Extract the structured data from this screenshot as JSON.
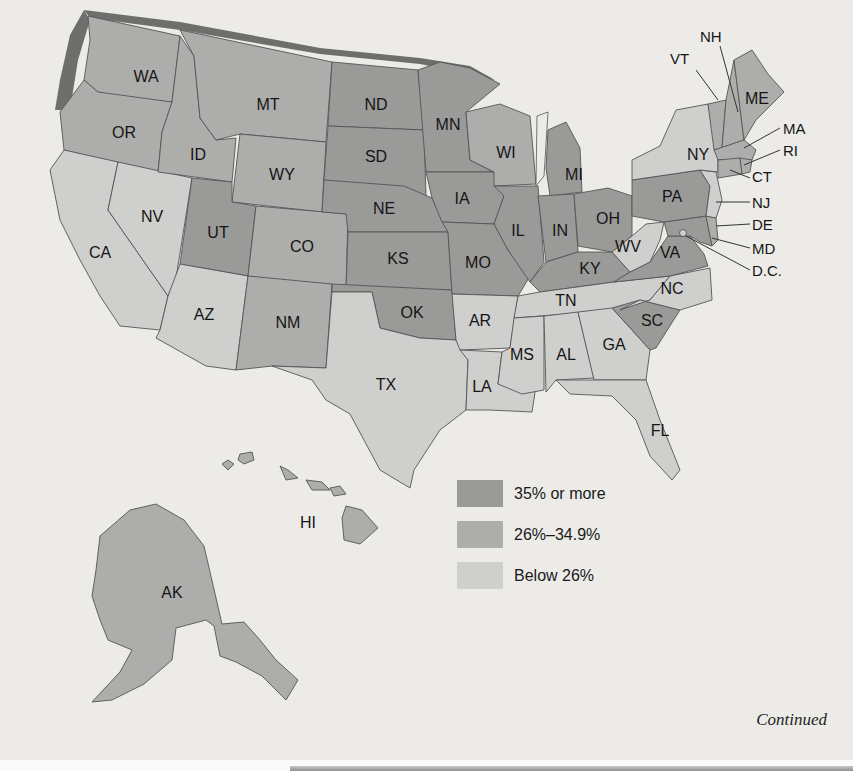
{
  "map": {
    "type": "choropleth",
    "region": "United States",
    "colors": {
      "high": "#9a9a98",
      "mid": "#adadab",
      "low": "#cfcfcd",
      "shadow": "#6e6e6c",
      "background": "#ecebe8"
    },
    "legend": [
      {
        "key": "high",
        "label": "35% or more"
      },
      {
        "key": "mid",
        "label": "26%–34.9%"
      },
      {
        "key": "low",
        "label": "Below 26%"
      }
    ],
    "states": {
      "WA": "mid",
      "OR": "mid",
      "CA": "low",
      "NV": "low",
      "ID": "mid",
      "MT": "mid",
      "WY": "mid",
      "UT": "high",
      "CO": "mid",
      "AZ": "low",
      "NM": "mid",
      "ND": "high",
      "SD": "high",
      "NE": "high",
      "KS": "high",
      "OK": "high",
      "TX": "low",
      "MN": "high",
      "IA": "high",
      "MO": "high",
      "AR": "low",
      "LA": "low",
      "WI": "mid",
      "IL": "high",
      "MI": "high",
      "IN": "high",
      "OH": "high",
      "KY": "high",
      "TN": "low",
      "MS": "low",
      "AL": "low",
      "GA": "low",
      "FL": "low",
      "SC": "high",
      "NC": "low",
      "VA": "high",
      "WV": "low",
      "PA": "high",
      "NY": "low",
      "VT": "mid",
      "NH": "mid",
      "ME": "mid",
      "MA": "mid",
      "RI": "mid",
      "CT": "mid",
      "NJ": "low",
      "DE": "mid",
      "MD": "high",
      "DC": "low",
      "AK": "mid",
      "HI": "mid"
    },
    "labels": {
      "WA": "WA",
      "OR": "OR",
      "CA": "CA",
      "NV": "NV",
      "ID": "ID",
      "MT": "MT",
      "WY": "WY",
      "UT": "UT",
      "CO": "CO",
      "AZ": "AZ",
      "NM": "NM",
      "ND": "ND",
      "SD": "SD",
      "NE": "NE",
      "KS": "KS",
      "OK": "OK",
      "TX": "TX",
      "MN": "MN",
      "IA": "IA",
      "MO": "MO",
      "AR": "AR",
      "LA": "LA",
      "WI": "WI",
      "IL": "IL",
      "MI": "MI",
      "IN": "IN",
      "OH": "OH",
      "KY": "KY",
      "TN": "TN",
      "MS": "MS",
      "AL": "AL",
      "GA": "GA",
      "FL": "FL",
      "SC": "SC",
      "NC": "NC",
      "VA": "VA",
      "WV": "WV",
      "PA": "PA",
      "NY": "NY",
      "VT": "VT",
      "NH": "NH",
      "ME": "ME",
      "MA": "MA",
      "RI": "RI",
      "CT": "CT",
      "NJ": "NJ",
      "DE": "DE",
      "MD": "MD",
      "DC": "D.C.",
      "AK": "AK",
      "HI": "HI"
    }
  },
  "footer": {
    "continued": "Continued"
  }
}
